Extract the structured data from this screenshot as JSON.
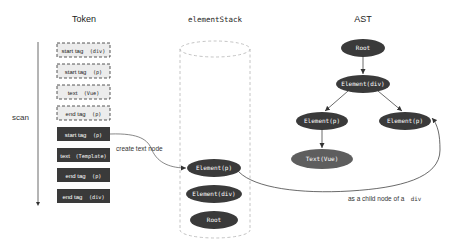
{
  "columns": {
    "token": "Token",
    "stack": "elementStack",
    "ast": "AST"
  },
  "scan_label": "scan",
  "tokens": [
    {
      "label": "start tag",
      "arg": "(div)",
      "style": "pending"
    },
    {
      "label": "start tag",
      "arg": "(p)",
      "style": "pending"
    },
    {
      "label": "text",
      "arg": "(Vue)",
      "style": "pending"
    },
    {
      "label": "end tag",
      "arg": "(p)",
      "style": "pending"
    },
    {
      "label": "start tag",
      "arg": "(p)",
      "style": "consumed"
    },
    {
      "label": "text",
      "arg": "(Template)",
      "style": "consumed"
    },
    {
      "label": "end tag",
      "arg": "(p)",
      "style": "consumed"
    },
    {
      "label": "end tag",
      "arg": "(div)",
      "style": "consumed"
    }
  ],
  "stack_items": [
    {
      "label": "Element(p)"
    },
    {
      "label": "Element(div)"
    },
    {
      "label": "Root"
    }
  ],
  "ast_nodes": {
    "root": "Root",
    "div": "Element(div)",
    "p_left": "Element(p)",
    "p_right": "Element(p)",
    "text_vue": "Text(Vue)"
  },
  "annotations": {
    "create_text_node": "create text node",
    "child_of_prefix": "as a child node of a",
    "child_of_tag": "div"
  },
  "colors": {
    "node_dark": "#3a3a3a",
    "node_light": "#5e5e5e",
    "pending_fill": "#ececec",
    "dashed": "#b5b5b5",
    "line": "#444444"
  }
}
